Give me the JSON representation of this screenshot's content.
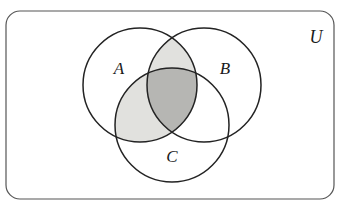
{
  "figure": {
    "type": "venn-diagram",
    "set_count": 3,
    "shaded_expression": "A ∩ (B ∪ C)",
    "background_color": "#ffffff"
  },
  "universe": {
    "label": "U",
    "label_x": 316,
    "label_y": 39,
    "rect": {
      "x": 6,
      "y": 11,
      "width": 328,
      "height": 188,
      "rx": 14
    },
    "stroke_color": "#555555",
    "fill_color": "#ffffff"
  },
  "circles": [
    {
      "id": "A",
      "label": "A",
      "cx": 140,
      "cy": 85,
      "r": 57,
      "label_x": 119,
      "label_y": 70,
      "stroke_color": "#232323",
      "fill_color": "none"
    },
    {
      "id": "B",
      "label": "B",
      "cx": 204,
      "cy": 85,
      "r": 57,
      "label_x": 225,
      "label_y": 70,
      "stroke_color": "#232323",
      "fill_color": "none"
    },
    {
      "id": "C",
      "label": "C",
      "cx": 172,
      "cy": 125,
      "r": 57,
      "label_x": 172,
      "label_y": 158,
      "stroke_color": "#232323",
      "fill_color": "none"
    }
  ],
  "regions": [
    {
      "id": "A-and-B-only",
      "name": "A ∩ B (excluding C)",
      "shaded": true,
      "fill_color": "#e1e1de"
    },
    {
      "id": "A-and-C-only",
      "name": "A ∩ C (excluding B)",
      "shaded": true,
      "fill_color": "#e1e1de"
    },
    {
      "id": "A-and-B-and-C",
      "name": "A ∩ B ∩ C",
      "shaded": true,
      "fill_color": "#b6b6b3"
    },
    {
      "id": "B-and-C-only",
      "name": "B ∩ C (excluding A)",
      "shaded": false,
      "fill_color": "#ffffff"
    },
    {
      "id": "A-only",
      "name": "A only",
      "shaded": false,
      "fill_color": "#ffffff"
    },
    {
      "id": "B-only",
      "name": "B only",
      "shaded": false,
      "fill_color": "#ffffff"
    },
    {
      "id": "C-only",
      "name": "C only",
      "shaded": false,
      "fill_color": "#ffffff"
    },
    {
      "id": "outside-all",
      "name": "U outside A, B, C",
      "shaded": false,
      "fill_color": "#ffffff"
    }
  ],
  "colors": {
    "light_shade": "#e1e1de",
    "dark_shade": "#b6b6b3",
    "circle_stroke": "#232323",
    "rect_stroke": "#555555",
    "label_color": "#1a1a1a"
  }
}
